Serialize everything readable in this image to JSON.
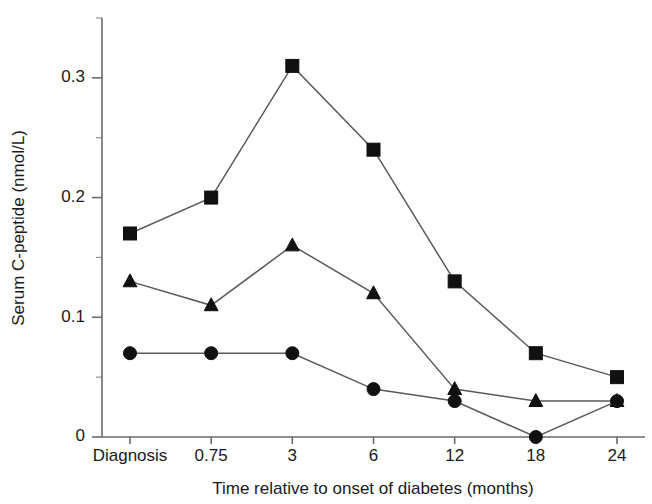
{
  "chart_data": {
    "type": "line",
    "title": "",
    "subtitle": "",
    "xlabel": "Time relative to onset of diabetes (months)",
    "ylabel": "Serum C-peptide (nmol/L)",
    "categories": [
      "Diagnosis",
      "0.75",
      "3",
      "6",
      "12",
      "18",
      "24"
    ],
    "ytick_labels": [
      "0",
      "0.1",
      "0.2",
      "0.3"
    ],
    "ytick_values": [
      0,
      0.1,
      0.2,
      0.3
    ],
    "yminor_values": [
      0.05,
      0.15,
      0.25,
      0.35
    ],
    "ylim": [
      0,
      0.35
    ],
    "grid": false,
    "legend": "none",
    "series": [
      {
        "name": "series-square",
        "marker": "square",
        "color": "#111111",
        "values": [
          0.17,
          0.2,
          0.31,
          0.24,
          0.13,
          0.07,
          0.05
        ]
      },
      {
        "name": "series-triangle",
        "marker": "triangle",
        "color": "#111111",
        "values": [
          0.13,
          0.11,
          0.16,
          0.12,
          0.04,
          0.03,
          0.03
        ]
      },
      {
        "name": "series-circle",
        "marker": "circle",
        "color": "#111111",
        "values": [
          0.07,
          0.07,
          0.07,
          0.04,
          0.03,
          0.0,
          0.03
        ]
      }
    ]
  }
}
